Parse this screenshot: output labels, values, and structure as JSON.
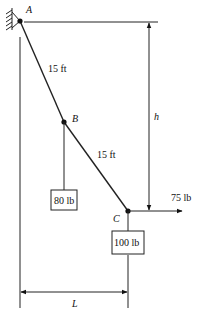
{
  "diagram": {
    "points": {
      "A": {
        "label": "A"
      },
      "B": {
        "label": "B"
      },
      "C": {
        "label": "C"
      }
    },
    "segments": {
      "AB": {
        "length_label": "15 ft"
      },
      "BC": {
        "length_label": "15 ft"
      }
    },
    "loads": {
      "B_weight": {
        "label": "80 lb"
      },
      "C_weight": {
        "label": "100 lb"
      },
      "C_horizontal_force": {
        "label": "75 lb",
        "direction": "right"
      }
    },
    "dimensions": {
      "vertical": {
        "label": "h"
      },
      "horizontal": {
        "label": "L"
      }
    },
    "support": {
      "type": "fixed-wall-pin",
      "at": "A"
    }
  }
}
